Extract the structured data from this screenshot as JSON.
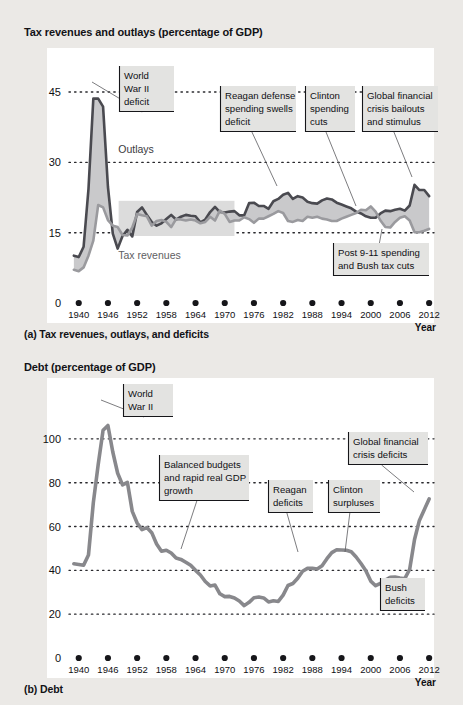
{
  "figure": {
    "background_color": "#ebe9e6",
    "panel_color": "#ffffff"
  },
  "colors": {
    "outlays_line": "#4a4a50",
    "revenues_line": "#9a9a9e",
    "debt_line": "#88888c",
    "deficit_fill": "#c9c9cb",
    "highlight_band": "#dcdcdc",
    "callout_bg": "#e3e3e1",
    "gridline": "#2a2a2e",
    "axis": "#2a2a2e"
  },
  "panel_a": {
    "title": "Tax revenues and outlays (percentage of GDP)",
    "caption": "(a) Tax revenues, outlays, and deficits",
    "axis_x_name": "Year",
    "series_labels": [
      {
        "name": "outlays-label",
        "text": "Outlays",
        "x": 0.135,
        "y": 32.0
      },
      {
        "name": "tax-revenues-label",
        "text": "Tax revenues",
        "x": 0.135,
        "y": 9.4
      }
    ],
    "highlight_band": {
      "name": "budget-balanced-band",
      "x0": 1948.2,
      "x1": 1972.0,
      "y0": 14.3,
      "y1": 21.8
    },
    "callouts": [
      {
        "name": "callout-world-war-ii-deficit",
        "lines": [
          "World",
          "War II",
          "deficit"
        ],
        "box": {
          "x": 119,
          "y": 66,
          "w": 55,
          "h": 46
        },
        "leader_to": {
          "x": 92,
          "y": 82
        }
      },
      {
        "name": "callout-reagan-defense",
        "lines": [
          "Reagan defense",
          "spending swells",
          "deficit"
        ],
        "box": {
          "x": 220,
          "y": 86,
          "w": 76,
          "h": 46
        },
        "leader_to": {
          "x": 277,
          "y": 186
        }
      },
      {
        "name": "callout-clinton-spending-cuts",
        "lines": [
          "Clinton",
          "spending",
          "cuts"
        ],
        "box": {
          "x": 305,
          "y": 86,
          "w": 50,
          "h": 46
        },
        "leader_to": {
          "x": 356,
          "y": 206
        }
      },
      {
        "name": "callout-global-financial-crisis",
        "lines": [
          "Global financial",
          "crisis bailouts",
          "and stimulus"
        ],
        "box": {
          "x": 362,
          "y": 86,
          "w": 76,
          "h": 46
        },
        "leader_to": {
          "x": 412,
          "y": 177
        }
      },
      {
        "name": "callout-post-911-spending",
        "lines": [
          "Post 9-11 spending",
          "and Bush tax cuts"
        ],
        "box": {
          "x": 333,
          "y": 243,
          "w": 96,
          "h": 33
        },
        "leader_to": {
          "x": 382,
          "y": 229
        }
      }
    ]
  },
  "panel_b": {
    "title": "Debt (percentage of GDP)",
    "caption": "(b) Debt",
    "axis_x_name": "Year",
    "callouts": [
      {
        "name": "callout-world-war-ii",
        "lines": [
          "World",
          "War II"
        ],
        "box": {
          "x": 123,
          "y": 384,
          "w": 50,
          "h": 33
        },
        "leader_to": {
          "x": 101,
          "y": 400
        }
      },
      {
        "name": "callout-balanced-budgets",
        "lines": [
          "Balanced budgets",
          "and rapid real GDP",
          "growth"
        ],
        "box": {
          "x": 159,
          "y": 455,
          "w": 90,
          "h": 46
        },
        "leader_to": {
          "x": 181,
          "y": 549
        }
      },
      {
        "name": "callout-reagan-deficits",
        "lines": [
          "Reagan",
          "deficits"
        ],
        "box": {
          "x": 268,
          "y": 480,
          "w": 45,
          "h": 33
        },
        "leader_to": {
          "x": 298,
          "y": 552
        }
      },
      {
        "name": "callout-clinton-surpluses",
        "lines": [
          "Clinton",
          "surpluses"
        ],
        "box": {
          "x": 328,
          "y": 480,
          "w": 52,
          "h": 33
        },
        "leader_to": {
          "x": 345,
          "y": 552
        }
      },
      {
        "name": "callout-global-financial-crisis-deficits",
        "lines": [
          "Global financial",
          "crisis deficits"
        ],
        "box": {
          "x": 348,
          "y": 432,
          "w": 80,
          "h": 33
        },
        "leader_to": {
          "x": 414,
          "y": 492
        }
      },
      {
        "name": "callout-bush-deficits",
        "lines": [
          "Bush",
          "deficits"
        ],
        "box": {
          "x": 380,
          "y": 578,
          "w": 45,
          "h": 33
        },
        "leader_to": {
          "x": 388,
          "y": 577
        }
      }
    ]
  },
  "chart_data": [
    {
      "type": "area",
      "name": "tax-revenues-and-outlays",
      "title": "Tax revenues and outlays (percentage of GDP)",
      "xlabel": "Year",
      "ylabel": "",
      "xlim": [
        1938,
        2013
      ],
      "ylim": [
        0,
        48
      ],
      "yticks": [
        0,
        15,
        30,
        45
      ],
      "xticks": [
        1940,
        1946,
        1952,
        1958,
        1964,
        1970,
        1976,
        1982,
        1988,
        1994,
        2000,
        2006,
        2012
      ],
      "grid": true,
      "legend": "inline-labels",
      "x": [
        1939,
        1940,
        1941,
        1942,
        1943,
        1944,
        1945,
        1946,
        1947,
        1948,
        1949,
        1950,
        1951,
        1952,
        1953,
        1954,
        1955,
        1956,
        1957,
        1958,
        1959,
        1960,
        1961,
        1962,
        1963,
        1964,
        1965,
        1966,
        1967,
        1968,
        1969,
        1970,
        1971,
        1972,
        1973,
        1974,
        1975,
        1976,
        1977,
        1978,
        1979,
        1980,
        1981,
        1982,
        1983,
        1984,
        1985,
        1986,
        1987,
        1988,
        1989,
        1990,
        1991,
        1992,
        1993,
        1994,
        1995,
        1996,
        1997,
        1998,
        1999,
        2000,
        2001,
        2002,
        2003,
        2004,
        2005,
        2006,
        2007,
        2008,
        2009,
        2010,
        2011,
        2012
      ],
      "series": [
        {
          "name": "Outlays",
          "color": "#4a4a50",
          "values": [
            10.1,
            9.8,
            12.0,
            24.3,
            43.6,
            43.6,
            41.9,
            24.8,
            14.8,
            11.6,
            14.3,
            15.6,
            14.2,
            19.4,
            20.4,
            18.8,
            17.3,
            16.5,
            17.0,
            17.9,
            18.8,
            17.8,
            18.4,
            18.8,
            18.6,
            18.5,
            17.2,
            17.8,
            19.4,
            20.5,
            19.4,
            19.3,
            19.5,
            19.6,
            18.7,
            18.7,
            21.3,
            21.4,
            20.7,
            20.7,
            20.1,
            21.7,
            22.2,
            23.1,
            23.5,
            22.2,
            22.8,
            22.5,
            21.6,
            21.3,
            21.2,
            21.9,
            22.3,
            22.1,
            21.4,
            21.0,
            20.6,
            20.2,
            19.5,
            19.1,
            18.5,
            18.2,
            18.2,
            19.1,
            19.7,
            19.6,
            19.9,
            20.1,
            19.7,
            20.8,
            25.2,
            24.1,
            24.1,
            22.8
          ]
        },
        {
          "name": "Tax revenues",
          "color": "#9a9a9e",
          "values": [
            7.1,
            6.8,
            7.6,
            10.1,
            13.3,
            20.9,
            20.4,
            17.7,
            16.5,
            16.2,
            14.5,
            14.4,
            16.1,
            19.0,
            18.7,
            18.5,
            16.5,
            17.5,
            17.7,
            17.3,
            16.2,
            17.9,
            17.8,
            17.6,
            17.8,
            17.6,
            17.0,
            17.3,
            18.4,
            17.6,
            19.7,
            19.0,
            17.3,
            17.6,
            17.6,
            18.3,
            17.9,
            17.1,
            18.0,
            18.0,
            18.5,
            19.0,
            19.6,
            19.2,
            17.5,
            17.3,
            17.7,
            17.5,
            18.4,
            18.2,
            18.4,
            18.0,
            17.8,
            17.5,
            17.5,
            18.0,
            18.4,
            18.8,
            19.2,
            19.9,
            19.8,
            20.6,
            19.5,
            17.6,
            16.2,
            16.1,
            17.3,
            18.2,
            18.5,
            17.6,
            15.1,
            15.1,
            15.4,
            15.8
          ]
        }
      ]
    },
    {
      "type": "line",
      "name": "debt-percentage-of-gdp",
      "title": "Debt (percentage of GDP)",
      "xlabel": "Year",
      "ylabel": "",
      "xlim": [
        1938,
        2013
      ],
      "ylim": [
        0,
        115
      ],
      "yticks": [
        0,
        20,
        40,
        60,
        80,
        100
      ],
      "xticks": [
        1940,
        1946,
        1952,
        1958,
        1964,
        1970,
        1976,
        1982,
        1988,
        1994,
        2000,
        2006,
        2012
      ],
      "grid": true,
      "x": [
        1939,
        1940,
        1941,
        1942,
        1943,
        1944,
        1945,
        1946,
        1947,
        1948,
        1949,
        1950,
        1951,
        1952,
        1953,
        1954,
        1955,
        1956,
        1957,
        1958,
        1959,
        1960,
        1961,
        1962,
        1963,
        1964,
        1965,
        1966,
        1967,
        1968,
        1969,
        1970,
        1971,
        1972,
        1973,
        1974,
        1975,
        1976,
        1977,
        1978,
        1979,
        1980,
        1981,
        1982,
        1983,
        1984,
        1985,
        1986,
        1987,
        1988,
        1989,
        1990,
        1991,
        1992,
        1993,
        1994,
        1995,
        1996,
        1997,
        1998,
        1999,
        2000,
        2001,
        2002,
        2003,
        2004,
        2005,
        2006,
        2007,
        2008,
        2009,
        2010,
        2011,
        2012
      ],
      "series": [
        {
          "name": "Debt",
          "color": "#88888c",
          "values": [
            43.0,
            42.7,
            42.3,
            47.0,
            70.9,
            88.3,
            103.9,
            106.1,
            94.0,
            84.3,
            79.0,
            80.2,
            66.9,
            61.6,
            58.6,
            59.5,
            57.2,
            52.0,
            48.7,
            49.2,
            47.9,
            45.6,
            45.0,
            43.7,
            42.3,
            40.0,
            37.9,
            34.9,
            32.9,
            33.3,
            29.3,
            28.0,
            28.1,
            27.4,
            26.0,
            23.9,
            25.4,
            27.5,
            27.8,
            27.4,
            25.6,
            26.1,
            25.8,
            28.7,
            33.1,
            34.0,
            36.4,
            39.6,
            40.9,
            40.9,
            40.6,
            42.1,
            45.3,
            48.1,
            49.4,
            49.3,
            49.2,
            48.5,
            46.1,
            43.1,
            39.8,
            35.1,
            33.0,
            34.1,
            35.6,
            36.8,
            36.9,
            36.5,
            36.2,
            40.5,
            54.1,
            62.8,
            67.7,
            72.6
          ]
        }
      ]
    }
  ]
}
